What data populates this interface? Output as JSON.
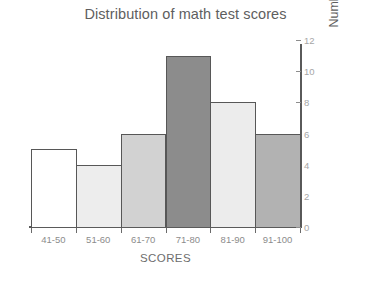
{
  "chart_data": {
    "type": "bar",
    "title": "Distribution of math test scores",
    "xlabel": "SCORES",
    "ylabel": "Number of Students",
    "categories": [
      "41-50",
      "51-60",
      "61-70",
      "71-80",
      "81-90",
      "91-100"
    ],
    "values": [
      5,
      4,
      6,
      11,
      8,
      6
    ],
    "ylim": [
      0,
      12
    ],
    "yticks": [
      0,
      2,
      4,
      6,
      8,
      10,
      12
    ],
    "ytick_labels": [
      "0",
      "2",
      "4",
      "6",
      "8",
      "10",
      "12"
    ],
    "grid": false,
    "legend": false,
    "legend_position": "none",
    "y_axis_side": "right",
    "bar_gap": 0,
    "bar_colors": [
      "#ffffff",
      "#ededed",
      "#d2d2d2",
      "#8c8c8c",
      "#ececec",
      "#b2b2b2"
    ],
    "bar_border_color": "#575757",
    "axis_color": "#5a5a5a",
    "title_color": "#5e5e5e",
    "tick_label_color": "#8c8c8c",
    "background": "#ffffff"
  }
}
